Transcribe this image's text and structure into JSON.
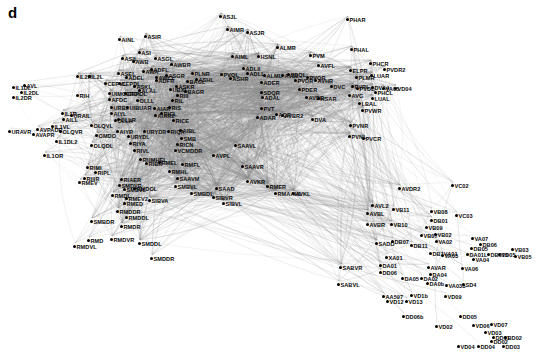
{
  "figure": {
    "panel_letter": "d",
    "type": "network-graph",
    "node_color": "#000000",
    "edge_color": "#888888",
    "background_color": "#ffffff",
    "label_color": "#0a0a0a"
  },
  "graph_data": {
    "type": "network",
    "node_count": 279,
    "nodes": [
      {
        "label": "ASJL",
        "x": 221,
        "y": 13
      },
      {
        "label": "AIMR",
        "x": 228,
        "y": 26
      },
      {
        "label": "ASJR",
        "x": 248,
        "y": 29
      },
      {
        "label": "PHAR",
        "x": 348,
        "y": 16
      },
      {
        "label": "AINL",
        "x": 120,
        "y": 36
      },
      {
        "label": "ASIR",
        "x": 146,
        "y": 33
      },
      {
        "label": "ALMR",
        "x": 278,
        "y": 44
      },
      {
        "label": "PVM",
        "x": 311,
        "y": 52
      },
      {
        "label": "PHAL",
        "x": 352,
        "y": 46
      },
      {
        "label": "AIML",
        "x": 233,
        "y": 53
      },
      {
        "label": "HSNL",
        "x": 259,
        "y": 53
      },
      {
        "label": "ASIL",
        "x": 123,
        "y": 55
      },
      {
        "label": "ASI",
        "x": 140,
        "y": 49
      },
      {
        "label": "AWB",
        "x": 134,
        "y": 58
      },
      {
        "label": "ASGL",
        "x": 156,
        "y": 55
      },
      {
        "label": "AWBR",
        "x": 172,
        "y": 61
      },
      {
        "label": "AVFL",
        "x": 319,
        "y": 62
      },
      {
        "label": "PHCR",
        "x": 371,
        "y": 60
      },
      {
        "label": "ADLII",
        "x": 244,
        "y": 65
      },
      {
        "label": "ADLL",
        "x": 248,
        "y": 70
      },
      {
        "label": "PVQL",
        "x": 222,
        "y": 71
      },
      {
        "label": "ALML",
        "x": 265,
        "y": 72
      },
      {
        "label": "PLNR",
        "x": 193,
        "y": 70
      },
      {
        "label": "ASEL",
        "x": 119,
        "y": 70
      },
      {
        "label": "AWA",
        "x": 144,
        "y": 68
      },
      {
        "label": "ADFL",
        "x": 152,
        "y": 66
      },
      {
        "label": "ADEL",
        "x": 127,
        "y": 74
      },
      {
        "label": "ASHR",
        "x": 231,
        "y": 75
      },
      {
        "label": "ASGR",
        "x": 167,
        "y": 72
      },
      {
        "label": "ADFR",
        "x": 157,
        "y": 77
      },
      {
        "label": "AWCL",
        "x": 157,
        "y": 74
      },
      {
        "label": "IL2R",
        "x": 78,
        "y": 73
      },
      {
        "label": "IL2L",
        "x": 90,
        "y": 73
      },
      {
        "label": "CEPVL",
        "x": 106,
        "y": 80
      },
      {
        "label": "CEPDL",
        "x": 120,
        "y": 80
      },
      {
        "label": "BAGL",
        "x": 188,
        "y": 78
      },
      {
        "label": "ASHL",
        "x": 197,
        "y": 76
      },
      {
        "label": "ASKL",
        "x": 135,
        "y": 83
      },
      {
        "label": "ALAL",
        "x": 140,
        "y": 87
      },
      {
        "label": "ASKR",
        "x": 177,
        "y": 83
      },
      {
        "label": "ADER",
        "x": 262,
        "y": 79
      },
      {
        "label": "PVDR",
        "x": 296,
        "y": 77
      },
      {
        "label": "AVDL",
        "x": 283,
        "y": 72
      },
      {
        "label": "SDQL",
        "x": 289,
        "y": 71
      },
      {
        "label": "AVHR",
        "x": 316,
        "y": 77
      },
      {
        "label": "PVQR",
        "x": 308,
        "y": 74
      },
      {
        "label": "ELPR",
        "x": 351,
        "y": 67
      },
      {
        "label": "PVDR2",
        "x": 385,
        "y": 66
      },
      {
        "label": "LUAR",
        "x": 372,
        "y": 72
      },
      {
        "label": "PLMR",
        "x": 357,
        "y": 74
      },
      {
        "label": "IL1DL",
        "x": 14,
        "y": 84
      },
      {
        "label": "AVL",
        "x": 25,
        "y": 82
      },
      {
        "label": "IL2DL",
        "x": 22,
        "y": 89
      },
      {
        "label": "IL2DR",
        "x": 14,
        "y": 94
      },
      {
        "label": "RIH",
        "x": 78,
        "y": 92
      },
      {
        "label": "UBXL",
        "x": 171,
        "y": 86
      },
      {
        "label": "RIII",
        "x": 178,
        "y": 92
      },
      {
        "label": "BAGR",
        "x": 186,
        "y": 88
      },
      {
        "label": "UIMCEPOL",
        "x": 110,
        "y": 90
      },
      {
        "label": "CEPOL",
        "x": 126,
        "y": 90
      },
      {
        "label": "AFDC",
        "x": 110,
        "y": 96
      },
      {
        "label": "OLLL",
        "x": 138,
        "y": 97
      },
      {
        "label": "RIL",
        "x": 173,
        "y": 97
      },
      {
        "label": "SDQR",
        "x": 262,
        "y": 89
      },
      {
        "label": "ADAL",
        "x": 263,
        "y": 94
      },
      {
        "label": "PDER",
        "x": 300,
        "y": 86
      },
      {
        "label": "DVC",
        "x": 332,
        "y": 83
      },
      {
        "label": "AVG",
        "x": 350,
        "y": 92
      },
      {
        "label": "PVRL",
        "x": 353,
        "y": 83
      },
      {
        "label": "PVDL",
        "x": 358,
        "y": 85
      },
      {
        "label": "DVA4",
        "x": 373,
        "y": 84
      },
      {
        "label": "VD04",
        "x": 396,
        "y": 85
      },
      {
        "label": "VA05",
        "x": 384,
        "y": 85
      },
      {
        "label": "PHCL",
        "x": 376,
        "y": 89
      },
      {
        "label": "LUAL",
        "x": 373,
        "y": 95
      },
      {
        "label": "LBAL",
        "x": 360,
        "y": 100
      },
      {
        "label": "AVDR",
        "x": 307,
        "y": 94
      },
      {
        "label": "HSAR",
        "x": 319,
        "y": 95
      },
      {
        "label": "URAVR",
        "x": 10,
        "y": 128
      },
      {
        "label": "AVPADR",
        "x": 38,
        "y": 126
      },
      {
        "label": "AVAPR",
        "x": 34,
        "y": 131
      },
      {
        "label": "URBL",
        "x": 112,
        "y": 104
      },
      {
        "label": "UIBUAR",
        "x": 128,
        "y": 104
      },
      {
        "label": "AIYL",
        "x": 112,
        "y": 110
      },
      {
        "label": "OLLA",
        "x": 116,
        "y": 117
      },
      {
        "label": "OLLR",
        "x": 119,
        "y": 116
      },
      {
        "label": "RICL",
        "x": 162,
        "y": 110
      },
      {
        "label": "RICE",
        "x": 174,
        "y": 117
      },
      {
        "label": "AIAR",
        "x": 155,
        "y": 105
      },
      {
        "label": "RIS",
        "x": 170,
        "y": 104
      },
      {
        "label": "AIAR2",
        "x": 156,
        "y": 112
      },
      {
        "label": "AIYR",
        "x": 118,
        "y": 128
      },
      {
        "label": "URYDR",
        "x": 145,
        "y": 128
      },
      {
        "label": "PVT",
        "x": 262,
        "y": 105
      },
      {
        "label": "ADAR",
        "x": 258,
        "y": 114
      },
      {
        "label": "AVBR2",
        "x": 283,
        "y": 112
      },
      {
        "label": "AQR",
        "x": 277,
        "y": 111
      },
      {
        "label": "DVA",
        "x": 313,
        "y": 116
      },
      {
        "label": "PVWR",
        "x": 363,
        "y": 107
      },
      {
        "label": "PVNR",
        "x": 351,
        "y": 122
      },
      {
        "label": "PVNL",
        "x": 350,
        "y": 133
      },
      {
        "label": "PVCR",
        "x": 364,
        "y": 135
      },
      {
        "label": "IL1R",
        "x": 63,
        "y": 110
      },
      {
        "label": "AILL",
        "x": 64,
        "y": 116
      },
      {
        "label": "URAIL",
        "x": 72,
        "y": 112
      },
      {
        "label": "IL1VL",
        "x": 53,
        "y": 123
      },
      {
        "label": "OLQVR",
        "x": 61,
        "y": 128
      },
      {
        "label": "OLQVL",
        "x": 92,
        "y": 122
      },
      {
        "label": "IL1DL2",
        "x": 57,
        "y": 138
      },
      {
        "label": "IL1OR",
        "x": 45,
        "y": 152
      },
      {
        "label": "OLQDL",
        "x": 92,
        "y": 142
      },
      {
        "label": "OMDO",
        "x": 97,
        "y": 132
      },
      {
        "label": "URYDL",
        "x": 129,
        "y": 133
      },
      {
        "label": "RIYA",
        "x": 131,
        "y": 140
      },
      {
        "label": "RIVL",
        "x": 135,
        "y": 147
      },
      {
        "label": "RIQA",
        "x": 169,
        "y": 128
      },
      {
        "label": "AIBL",
        "x": 181,
        "y": 127
      },
      {
        "label": "SMB",
        "x": 182,
        "y": 135
      },
      {
        "label": "RICN",
        "x": 178,
        "y": 141
      },
      {
        "label": "VCMDDR",
        "x": 176,
        "y": 147
      },
      {
        "label": "SAAVL",
        "x": 236,
        "y": 142
      },
      {
        "label": "SAAVR",
        "x": 243,
        "y": 163
      },
      {
        "label": "AVKL",
        "x": 294,
        "y": 190
      },
      {
        "label": "AVKR",
        "x": 248,
        "y": 178
      },
      {
        "label": "RMER",
        "x": 268,
        "y": 183
      },
      {
        "label": "RMAAHL",
        "x": 276,
        "y": 190
      },
      {
        "label": "SMBDL",
        "x": 192,
        "y": 190
      },
      {
        "label": "SAAD",
        "x": 217,
        "y": 185
      },
      {
        "label": "SIBVR",
        "x": 214,
        "y": 194
      },
      {
        "label": "SIBVL",
        "x": 224,
        "y": 200
      },
      {
        "label": "RIMI",
        "x": 88,
        "y": 164
      },
      {
        "label": "RIPL",
        "x": 96,
        "y": 169
      },
      {
        "label": "RIIIR",
        "x": 85,
        "y": 175
      },
      {
        "label": "RMEV",
        "x": 80,
        "y": 179
      },
      {
        "label": "RMEV2",
        "x": 127,
        "y": 195
      },
      {
        "label": "RMED",
        "x": 125,
        "y": 200
      },
      {
        "label": "RMDDR",
        "x": 118,
        "y": 208
      },
      {
        "label": "RMDDL",
        "x": 127,
        "y": 214
      },
      {
        "label": "RMDVL",
        "x": 75,
        "y": 243
      },
      {
        "label": "RMD",
        "x": 89,
        "y": 237
      },
      {
        "label": "RMDVR",
        "x": 112,
        "y": 236
      },
      {
        "label": "RMDR",
        "x": 122,
        "y": 223
      },
      {
        "label": "SMDDL",
        "x": 140,
        "y": 240
      },
      {
        "label": "SMDDR",
        "x": 152,
        "y": 255
      },
      {
        "label": "RUMHEL",
        "x": 141,
        "y": 156
      },
      {
        "label": "RIBR",
        "x": 147,
        "y": 160
      },
      {
        "label": "RMEL",
        "x": 160,
        "y": 159
      },
      {
        "label": "RIAER",
        "x": 122,
        "y": 176
      },
      {
        "label": "SMDVL",
        "x": 125,
        "y": 186
      },
      {
        "label": "SMDVR",
        "x": 120,
        "y": 182
      },
      {
        "label": "RMDOL",
        "x": 135,
        "y": 185
      },
      {
        "label": "SIBVA",
        "x": 150,
        "y": 197
      },
      {
        "label": "RMDL",
        "x": 113,
        "y": 192
      },
      {
        "label": "AVPL",
        "x": 214,
        "y": 152
      },
      {
        "label": "RMFL",
        "x": 183,
        "y": 161
      },
      {
        "label": "SAAVM",
        "x": 178,
        "y": 175
      },
      {
        "label": "RMHL",
        "x": 170,
        "y": 168
      },
      {
        "label": "SMBVL",
        "x": 176,
        "y": 183
      },
      {
        "label": "SMBDR",
        "x": 92,
        "y": 218
      },
      {
        "label": "AVL2",
        "x": 373,
        "y": 202
      },
      {
        "label": "AVBL",
        "x": 368,
        "y": 210
      },
      {
        "label": "AVBR",
        "x": 368,
        "y": 221
      },
      {
        "label": "AVDR2",
        "x": 400,
        "y": 185
      },
      {
        "label": "VB11",
        "x": 394,
        "y": 206
      },
      {
        "label": "VB10",
        "x": 392,
        "y": 221
      },
      {
        "label": "VC02",
        "x": 453,
        "y": 182
      },
      {
        "label": "VB08",
        "x": 432,
        "y": 208
      },
      {
        "label": "VC03",
        "x": 457,
        "y": 212
      },
      {
        "label": "DB01",
        "x": 432,
        "y": 217
      },
      {
        "label": "VB09",
        "x": 427,
        "y": 224
      },
      {
        "label": "VB07",
        "x": 422,
        "y": 232
      },
      {
        "label": "VB02",
        "x": 436,
        "y": 231
      },
      {
        "label": "VA02",
        "x": 437,
        "y": 238
      },
      {
        "label": "DB07",
        "x": 393,
        "y": 238
      },
      {
        "label": "SADD",
        "x": 377,
        "y": 240
      },
      {
        "label": "DB11",
        "x": 412,
        "y": 242
      },
      {
        "label": "XA01",
        "x": 387,
        "y": 254
      },
      {
        "label": "DB1VA01",
        "x": 431,
        "y": 250
      },
      {
        "label": "VA03",
        "x": 443,
        "y": 252
      },
      {
        "label": "VA07",
        "x": 473,
        "y": 235
      },
      {
        "label": "DB06",
        "x": 481,
        "y": 241
      },
      {
        "label": "DB05",
        "x": 472,
        "y": 245
      },
      {
        "label": "VB03",
        "x": 513,
        "y": 246
      },
      {
        "label": "DB01b",
        "x": 489,
        "y": 251
      },
      {
        "label": "VD05",
        "x": 500,
        "y": 251
      },
      {
        "label": "VB05",
        "x": 516,
        "y": 253
      },
      {
        "label": "DA01L",
        "x": 468,
        "y": 251
      },
      {
        "label": "VA04",
        "x": 474,
        "y": 256
      },
      {
        "label": "SABVR",
        "x": 341,
        "y": 264
      },
      {
        "label": "DA01",
        "x": 381,
        "y": 262
      },
      {
        "label": "DD06",
        "x": 381,
        "y": 269
      },
      {
        "label": "SABVL",
        "x": 339,
        "y": 281
      },
      {
        "label": "DA05",
        "x": 403,
        "y": 275
      },
      {
        "label": "DA02",
        "x": 422,
        "y": 275
      },
      {
        "label": "AVAR",
        "x": 429,
        "y": 264
      },
      {
        "label": "VA06",
        "x": 463,
        "y": 265
      },
      {
        "label": "DA04",
        "x": 431,
        "y": 271
      },
      {
        "label": "DA0b",
        "x": 428,
        "y": 280
      },
      {
        "label": "VA03b",
        "x": 447,
        "y": 282
      },
      {
        "label": "SD4",
        "x": 464,
        "y": 281
      },
      {
        "label": "AA597",
        "x": 384,
        "y": 293
      },
      {
        "label": "VD12",
        "x": 388,
        "y": 298
      },
      {
        "label": "VD1b",
        "x": 412,
        "y": 292
      },
      {
        "label": "VD13",
        "x": 407,
        "y": 298
      },
      {
        "label": "VD09",
        "x": 446,
        "y": 293
      },
      {
        "label": "DD06b",
        "x": 404,
        "y": 313
      },
      {
        "label": "DD05",
        "x": 461,
        "y": 313
      },
      {
        "label": "VD02",
        "x": 437,
        "y": 323
      },
      {
        "label": "VD06",
        "x": 474,
        "y": 322
      },
      {
        "label": "VD07",
        "x": 492,
        "y": 321
      },
      {
        "label": "VD03",
        "x": 486,
        "y": 329
      },
      {
        "label": "DD01",
        "x": 494,
        "y": 334
      },
      {
        "label": "BD02",
        "x": 506,
        "y": 334
      },
      {
        "label": "VD04",
        "x": 459,
        "y": 343
      },
      {
        "label": "DD04",
        "x": 479,
        "y": 343
      },
      {
        "label": "DD03",
        "x": 504,
        "y": 343
      },
      {
        "label": "DD02",
        "x": 492,
        "y": 338
      }
    ]
  }
}
